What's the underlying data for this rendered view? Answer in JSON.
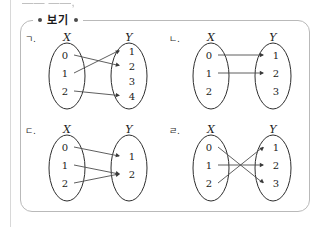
{
  "page": {
    "top_cut_text": "—— ——,",
    "bogi_label": "보기",
    "frame_color": "#b9b9b9"
  },
  "diagrams": [
    {
      "tag": "ㄱ.",
      "x_label": "X",
      "y_label": "Y",
      "x_elements": [
        "0",
        "1",
        "2"
      ],
      "y_elements": [
        "1",
        "2",
        "3",
        "4"
      ],
      "mappings": [
        {
          "from": "0",
          "to": "2"
        },
        {
          "from": "1",
          "to": "1"
        },
        {
          "from": "2",
          "to": "4"
        }
      ]
    },
    {
      "tag": "ㄴ.",
      "x_label": "X",
      "y_label": "Y",
      "x_elements": [
        "0",
        "1",
        "2"
      ],
      "y_elements": [
        "1",
        "2",
        "3"
      ],
      "mappings": [
        {
          "from": "0",
          "to": "1"
        },
        {
          "from": "1",
          "to": "2"
        }
      ]
    },
    {
      "tag": "ㄷ.",
      "x_label": "X",
      "y_label": "Y",
      "x_elements": [
        "0",
        "1",
        "2"
      ],
      "y_elements": [
        "1",
        "2"
      ],
      "mappings": [
        {
          "from": "0",
          "to": "1"
        },
        {
          "from": "1",
          "to": "2"
        },
        {
          "from": "2",
          "to": "2"
        }
      ]
    },
    {
      "tag": "ㄹ.",
      "x_label": "X",
      "y_label": "Y",
      "x_elements": [
        "0",
        "1",
        "2"
      ],
      "y_elements": [
        "1",
        "2",
        "3"
      ],
      "mappings": [
        {
          "from": "0",
          "to": "3"
        },
        {
          "from": "1",
          "to": "2"
        },
        {
          "from": "2",
          "to": "1"
        }
      ]
    }
  ]
}
